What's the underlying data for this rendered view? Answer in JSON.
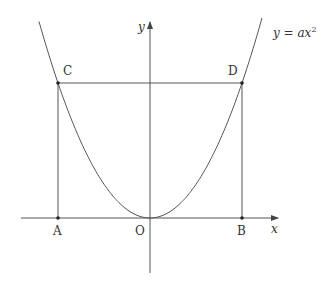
{
  "diagram": {
    "curve_label": "y = ax",
    "curve_exponent": "2",
    "axes": {
      "x_label": "x",
      "y_label": "y"
    },
    "points": [
      {
        "name": "C",
        "label": "C"
      },
      {
        "name": "D",
        "label": "D"
      },
      {
        "name": "A",
        "label": "A"
      },
      {
        "name": "O",
        "label": "O"
      },
      {
        "name": "B",
        "label": "B"
      }
    ],
    "colors": {
      "stroke": "#444444",
      "background": "#ffffff"
    }
  }
}
